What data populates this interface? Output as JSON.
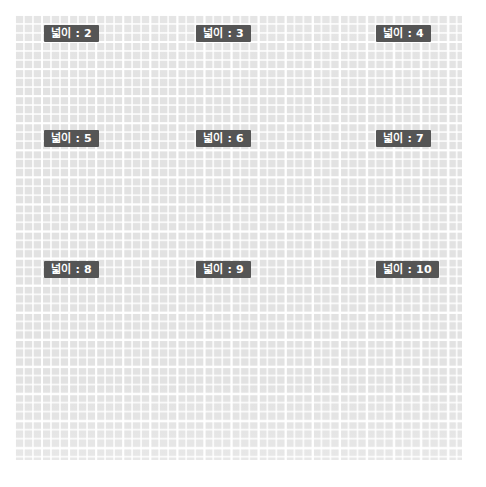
{
  "canvas": {
    "width": 486,
    "height": 487,
    "background_color": "#ffffff"
  },
  "grid": {
    "name": "graph-paper-grid",
    "left": 14,
    "top": 14,
    "width": 448,
    "height": 446,
    "fill_color": "#e2e2e2",
    "gridline_color": "#ffffff",
    "cell_size_px": 9,
    "major_line_every_cells": 3
  },
  "badge_style": {
    "background_color": "#555555",
    "text_color": "#ffffff"
  },
  "badges": [
    {
      "name": "area-badge-2",
      "label": "넓이 : 2",
      "value": 2,
      "x": 44,
      "y": 25
    },
    {
      "name": "area-badge-3",
      "label": "넓이 : 3",
      "value": 3,
      "x": 196,
      "y": 25
    },
    {
      "name": "area-badge-4",
      "label": "넓이 : 4",
      "value": 4,
      "x": 376,
      "y": 25
    },
    {
      "name": "area-badge-5",
      "label": "넓이 : 5",
      "value": 5,
      "x": 44,
      "y": 130
    },
    {
      "name": "area-badge-6",
      "label": "넓이 : 6",
      "value": 6,
      "x": 196,
      "y": 130
    },
    {
      "name": "area-badge-7",
      "label": "넓이 : 7",
      "value": 7,
      "x": 376,
      "y": 130
    },
    {
      "name": "area-badge-8",
      "label": "넓이 : 8",
      "value": 8,
      "x": 44,
      "y": 261
    },
    {
      "name": "area-badge-9",
      "label": "넓이 : 9",
      "value": 9,
      "x": 196,
      "y": 261
    },
    {
      "name": "area-badge-10",
      "label": "넓이 : 10",
      "value": 10,
      "x": 376,
      "y": 261
    }
  ]
}
